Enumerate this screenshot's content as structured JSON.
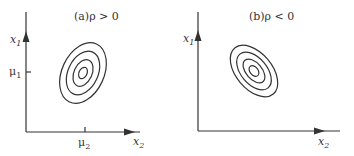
{
  "panels": [
    {
      "title": "(a)ρ > 0",
      "x_label": "x",
      "x_sub": "2",
      "y_label": "x",
      "y_sub": "1",
      "x_tick": "μ",
      "x_tick_sub": "2",
      "y_tick": "μ",
      "y_tick_sub": "1",
      "correlation": "positive"
    },
    {
      "title": "(b)ρ < 0",
      "x_label": "x",
      "x_sub": "2",
      "y_label": "x",
      "y_sub": "1",
      "correlation": "negative"
    }
  ],
  "colors": {
    "line": "#333333",
    "background": "#ffffff"
  }
}
